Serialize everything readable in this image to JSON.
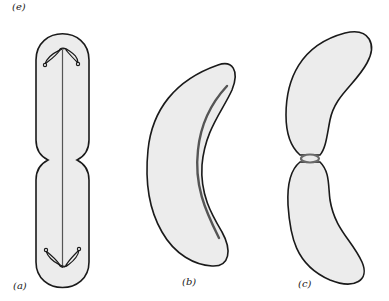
{
  "figure": {
    "top_label": "(e)",
    "panels": [
      {
        "id": "a",
        "label": "(a)",
        "description": "rod-shaped cell dividing with axial filament and chromosomes at poles"
      },
      {
        "id": "b",
        "label": "(b)",
        "description": "curved cell with internal filament"
      },
      {
        "id": "c",
        "label": "(c)",
        "description": "curved cell dividing with constriction ring"
      }
    ],
    "colors": {
      "outline": "#1a1a1a",
      "fill": "#ececec",
      "filament": "#555555",
      "ring": "#6a6a6a",
      "background": "#ffffff"
    }
  }
}
